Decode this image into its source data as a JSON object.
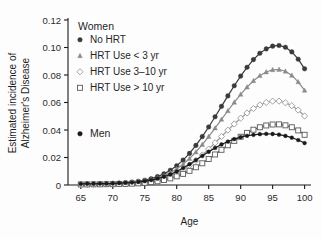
{
  "chart_data": {
    "type": "line",
    "title": "",
    "xlabel": "Age",
    "ylabel": "Estimated incidence of Alzheimer's Disease",
    "xlim": [
      63,
      101
    ],
    "ylim": [
      0,
      0.12
    ],
    "xticks": [
      65,
      70,
      75,
      80,
      85,
      90,
      95,
      100
    ],
    "xtick_labels": [
      "65",
      "70",
      "75",
      "80",
      "85",
      "90",
      "95",
      "100"
    ],
    "yticks": [
      0,
      0.02,
      0.04,
      0.06,
      0.08,
      0.1,
      0.12
    ],
    "ytick_labels": [
      "0",
      "0.02",
      "0.04",
      "0.06",
      "0.08",
      "0.10",
      "0.12"
    ],
    "grid": false,
    "legend_position": "upper-left-inside",
    "group_labels": [
      "Women",
      "Men"
    ],
    "x": [
      65,
      66,
      67,
      68,
      69,
      70,
      71,
      72,
      73,
      74,
      75,
      76,
      77,
      78,
      79,
      80,
      81,
      82,
      83,
      84,
      85,
      86,
      87,
      88,
      89,
      90,
      91,
      92,
      93,
      94,
      95,
      96,
      97,
      98,
      99,
      100
    ],
    "series": [
      {
        "name": "No HRT",
        "group": "Women",
        "marker": "filled-circle",
        "color": "#3a3a3a",
        "values": [
          0.0007,
          0.0008,
          0.0009,
          0.001,
          0.0011,
          0.0012,
          0.0014,
          0.0017,
          0.0021,
          0.0027,
          0.0035,
          0.0046,
          0.0061,
          0.0081,
          0.0107,
          0.014,
          0.0181,
          0.023,
          0.0288,
          0.0352,
          0.0422,
          0.0496,
          0.0572,
          0.0648,
          0.0722,
          0.0792,
          0.0856,
          0.0912,
          0.0958,
          0.099,
          0.101,
          0.1015,
          0.1002,
          0.0968,
          0.0915,
          0.0845
        ]
      },
      {
        "name": "HRT Use < 3 yr",
        "group": "Women",
        "marker": "filled-triangle",
        "color": "#8a8a8a",
        "values": [
          0.0006,
          0.0007,
          0.0008,
          0.0009,
          0.001,
          0.0011,
          0.0013,
          0.0015,
          0.0018,
          0.0023,
          0.003,
          0.0039,
          0.0051,
          0.0068,
          0.009,
          0.0117,
          0.0151,
          0.0192,
          0.024,
          0.0294,
          0.0352,
          0.0414,
          0.0477,
          0.054,
          0.0601,
          0.0659,
          0.0712,
          0.0758,
          0.0795,
          0.0822,
          0.0838,
          0.084,
          0.0827,
          0.0797,
          0.075,
          0.0688
        ]
      },
      {
        "name": "HRT Use 3–10 yr",
        "group": "Women",
        "marker": "open-diamond",
        "color": "#9a9a9a",
        "values": [
          0.0005,
          0.0005,
          0.0006,
          0.0007,
          0.0007,
          0.0008,
          0.0009,
          0.0011,
          0.0013,
          0.0017,
          0.0022,
          0.0029,
          0.0038,
          0.005,
          0.0067,
          0.0087,
          0.0112,
          0.0142,
          0.0178,
          0.0218,
          0.0261,
          0.0307,
          0.0353,
          0.0399,
          0.0444,
          0.0486,
          0.0524,
          0.0556,
          0.0582,
          0.06,
          0.061,
          0.061,
          0.0598,
          0.0577,
          0.0545,
          0.0502
        ]
      },
      {
        "name": "HRT Use > 10 yr",
        "group": "Women",
        "marker": "open-square",
        "color": "#5a5a5a",
        "values": [
          0.0004,
          0.0004,
          0.0005,
          0.0005,
          0.0006,
          0.0006,
          0.0007,
          0.0008,
          0.001,
          0.0012,
          0.0016,
          0.0021,
          0.0027,
          0.0036,
          0.0048,
          0.0063,
          0.0081,
          0.0103,
          0.0129,
          0.0158,
          0.0189,
          0.0222,
          0.0256,
          0.0289,
          0.0321,
          0.0351,
          0.0379,
          0.0402,
          0.042,
          0.0433,
          0.044,
          0.0441,
          0.0434,
          0.042,
          0.0397,
          0.0365
        ]
      },
      {
        "name": "Men",
        "group": "Men",
        "marker": "filled-circle-small",
        "color": "#1a1a1a",
        "values": [
          0.0008,
          0.0009,
          0.0009,
          0.001,
          0.001,
          0.0011,
          0.0013,
          0.0015,
          0.0018,
          0.0022,
          0.0028,
          0.0036,
          0.0046,
          0.006,
          0.0077,
          0.0098,
          0.0123,
          0.0151,
          0.0181,
          0.0212,
          0.0242,
          0.027,
          0.0295,
          0.0316,
          0.0334,
          0.0348,
          0.0358,
          0.0365,
          0.037,
          0.0372,
          0.0371,
          0.0366,
          0.0357,
          0.0344,
          0.0327,
          0.0305
        ]
      }
    ],
    "legend_entries": [
      {
        "label": "No HRT",
        "marker": "filled-circle"
      },
      {
        "label": "HRT Use < 3 yr",
        "marker": "filled-triangle"
      },
      {
        "label": "HRT Use 3–10 yr",
        "marker": "open-diamond"
      },
      {
        "label": "HRT Use > 10 yr",
        "marker": "open-square"
      }
    ],
    "men_legend": {
      "label": "Men",
      "marker": "filled-circle"
    }
  }
}
